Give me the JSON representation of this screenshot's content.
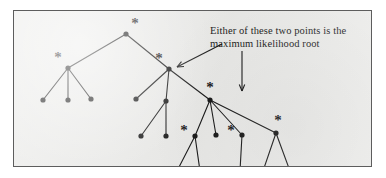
{
  "figure": {
    "kind": "phylogenetic-tree-diagram",
    "background_color": "#ffffff",
    "plate_color": "#ececea",
    "border_color": "#5d5d5d",
    "ink_color": "#1b1b1b"
  },
  "annotation": {
    "text": "Either of these two points is the\nmaximum likelihood root",
    "line1": "Either of these two points is the",
    "line2": "maximum likelihood root"
  },
  "arrows": [
    {
      "name": "arrow-to-left-candidate-root",
      "from": [
        208,
        33
      ],
      "to": [
        163,
        56
      ],
      "head": "arrowhead-left"
    },
    {
      "name": "arrow-to-right-candidate-root",
      "from": [
        228,
        40
      ],
      "to": [
        228,
        80
      ],
      "head": "arrowhead-down"
    }
  ],
  "chart_data": {
    "type": "tree",
    "title": "",
    "nodes": [
      {
        "id": "n-root-top",
        "x": 112,
        "y": 23,
        "star": true,
        "star_dx": 9,
        "star_dy": -9,
        "leaf": false
      },
      {
        "id": "n-left-internal",
        "x": 54,
        "y": 57,
        "star": true,
        "star_dx": -10,
        "star_dy": -9,
        "leaf": false
      },
      {
        "id": "leaf-l1",
        "x": 29,
        "y": 89,
        "star": false,
        "leaf": true
      },
      {
        "id": "leaf-l2",
        "x": 54,
        "y": 89,
        "star": false,
        "leaf": true
      },
      {
        "id": "leaf-l3",
        "x": 77,
        "y": 88,
        "star": false,
        "leaf": true
      },
      {
        "id": "n-candidate-left",
        "x": 155,
        "y": 58,
        "star": true,
        "star_dx": -10,
        "star_dy": -9,
        "leaf": false
      },
      {
        "id": "leaf-m1",
        "x": 122,
        "y": 88,
        "star": false,
        "leaf": true
      },
      {
        "id": "n-mid-internal",
        "x": 152,
        "y": 90,
        "star": false,
        "leaf": false
      },
      {
        "id": "leaf-m2",
        "x": 127,
        "y": 125,
        "star": false,
        "leaf": true
      },
      {
        "id": "leaf-m3",
        "x": 152,
        "y": 125,
        "star": false,
        "leaf": true
      },
      {
        "id": "n-candidate-right",
        "x": 196,
        "y": 89,
        "star": true,
        "star_dx": 0,
        "star_dy": -11,
        "leaf": false
      },
      {
        "id": "n-r1-internal",
        "x": 181,
        "y": 125,
        "star": true,
        "star_dx": -11,
        "star_dy": -4,
        "leaf": false
      },
      {
        "id": "leaf-r1a",
        "x": 163,
        "y": 160,
        "star": false,
        "leaf": true
      },
      {
        "id": "leaf-r1b",
        "x": 186,
        "y": 160,
        "star": false,
        "leaf": true
      },
      {
        "id": "leaf-r2",
        "x": 202,
        "y": 124,
        "star": false,
        "leaf": true
      },
      {
        "id": "n-r3-internal",
        "x": 228,
        "y": 124,
        "star": true,
        "star_dx": -11,
        "star_dy": -3,
        "leaf": false
      },
      {
        "id": "leaf-r3a",
        "x": 226,
        "y": 160,
        "star": false,
        "leaf": true
      },
      {
        "id": "n-r4-internal",
        "x": 262,
        "y": 122,
        "star": true,
        "star_dx": 2,
        "star_dy": -11,
        "leaf": false
      },
      {
        "id": "leaf-r4a",
        "x": 249,
        "y": 160,
        "star": false,
        "leaf": true
      },
      {
        "id": "leaf-r4b",
        "x": 276,
        "y": 160,
        "star": false,
        "leaf": true
      }
    ],
    "edges": [
      [
        "n-root-top",
        "n-left-internal"
      ],
      [
        "n-root-top",
        "n-candidate-left"
      ],
      [
        "n-left-internal",
        "leaf-l1"
      ],
      [
        "n-left-internal",
        "leaf-l2"
      ],
      [
        "n-left-internal",
        "leaf-l3"
      ],
      [
        "n-candidate-left",
        "leaf-m1"
      ],
      [
        "n-candidate-left",
        "n-mid-internal"
      ],
      [
        "n-candidate-left",
        "n-candidate-right"
      ],
      [
        "n-mid-internal",
        "leaf-m2"
      ],
      [
        "n-mid-internal",
        "leaf-m3"
      ],
      [
        "n-candidate-right",
        "n-r1-internal"
      ],
      [
        "n-candidate-right",
        "leaf-r2"
      ],
      [
        "n-candidate-right",
        "n-r3-internal"
      ],
      [
        "n-candidate-right",
        "n-r4-internal"
      ],
      [
        "n-r1-internal",
        "leaf-r1a"
      ],
      [
        "n-r1-internal",
        "leaf-r1b"
      ],
      [
        "n-r3-internal",
        "leaf-r3a"
      ],
      [
        "n-r4-internal",
        "leaf-r4a"
      ],
      [
        "n-r4-internal",
        "leaf-r4b"
      ]
    ],
    "star_marker": "*",
    "node_radius": 2.6,
    "edge_width": 1.1,
    "xlabel": "",
    "ylabel": "",
    "legend": []
  }
}
